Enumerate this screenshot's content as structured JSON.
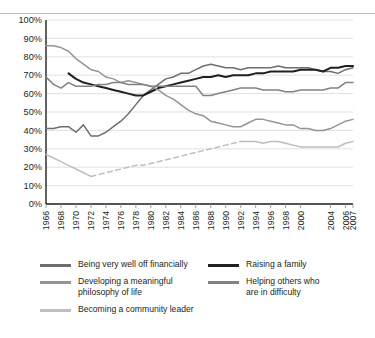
{
  "chart_data": {
    "type": "line",
    "title": "",
    "subtitle": "",
    "xlabel": "",
    "ylabel": "",
    "ylim": [
      0,
      100
    ],
    "y_unit": "%",
    "grid": true,
    "legend_position": "bottom",
    "y_ticks": [
      "0%",
      "10%",
      "20%",
      "30%",
      "40%",
      "50%",
      "60%",
      "70%",
      "80%",
      "90%",
      "100%"
    ],
    "y_tick_values": [
      0,
      10,
      20,
      30,
      40,
      50,
      60,
      70,
      80,
      90,
      100
    ],
    "x_tick_labels": [
      "1966",
      "1968",
      "1970",
      "1972",
      "1974",
      "1976",
      "1978",
      "1980",
      "1982",
      "1984",
      "1986",
      "1988",
      "1990",
      "1992",
      "1994",
      "1996",
      "1998",
      "2000",
      "2004",
      "2006",
      "2007"
    ],
    "x": [
      1966,
      1967,
      1968,
      1969,
      1970,
      1971,
      1972,
      1973,
      1974,
      1975,
      1976,
      1977,
      1978,
      1979,
      1980,
      1981,
      1982,
      1983,
      1984,
      1985,
      1986,
      1987,
      1988,
      1989,
      1990,
      1991,
      1992,
      1993,
      1994,
      1995,
      1996,
      1997,
      1998,
      1999,
      2000,
      2001,
      2002,
      2003,
      2004,
      2005,
      2006,
      2007
    ],
    "series": [
      {
        "name": "Being very well off financially",
        "color": "#6d6e71",
        "style": "solid",
        "values": [
          41,
          41,
          42,
          42,
          39,
          43,
          37,
          37,
          39,
          42,
          45,
          49,
          54,
          59,
          62,
          65,
          68,
          69,
          71,
          71,
          73,
          75,
          76,
          75,
          74,
          74,
          73,
          74,
          74,
          74,
          74,
          75,
          74,
          74,
          74,
          74,
          73,
          72,
          72,
          71,
          73,
          74
        ]
      },
      {
        "name": "Raising a family",
        "color": "#231f20",
        "style": "solid",
        "values": [
          null,
          null,
          null,
          71,
          68,
          66,
          65,
          64,
          63,
          62,
          61,
          60,
          59,
          59,
          61,
          63,
          64,
          65,
          66,
          67,
          68,
          69,
          69,
          70,
          69,
          70,
          70,
          70,
          71,
          71,
          72,
          72,
          72,
          72,
          73,
          73,
          73,
          72,
          74,
          74,
          75,
          75
        ]
      },
      {
        "name": "Developing a meaningful philosophy of life",
        "color": "#939598",
        "style": "solid",
        "values": [
          86,
          86,
          85,
          83,
          79,
          76,
          73,
          72,
          69,
          68,
          66,
          67,
          66,
          65,
          64,
          62,
          59,
          57,
          54,
          51,
          49,
          48,
          45,
          44,
          43,
          42,
          42,
          44,
          46,
          46,
          45,
          44,
          43,
          43,
          41,
          41,
          40,
          40,
          41,
          43,
          45,
          46
        ]
      },
      {
        "name": "Helping others who are in difficulty",
        "color": "#808285",
        "style": "solid",
        "values": [
          69,
          65,
          63,
          66,
          64,
          64,
          64,
          65,
          65,
          66,
          66,
          65,
          65,
          65,
          64,
          64,
          64,
          64,
          64,
          64,
          64,
          59,
          59,
          60,
          61,
          62,
          63,
          63,
          63,
          62,
          62,
          62,
          61,
          61,
          62,
          62,
          62,
          62,
          63,
          63,
          66,
          66
        ]
      },
      {
        "name": "Becoming a community leader",
        "color": "#bcbec0",
        "style": "solid-then-dashed",
        "dash_start": 1972,
        "dash_end": 1992,
        "values": [
          27,
          25,
          23,
          21,
          19,
          17,
          15,
          16,
          17,
          18,
          19,
          20,
          21,
          21,
          22,
          23,
          24,
          25,
          26,
          27,
          28,
          29,
          30,
          31,
          32,
          33,
          34,
          34,
          34,
          33,
          34,
          34,
          33,
          32,
          31,
          31,
          31,
          31,
          31,
          31,
          33,
          34
        ]
      }
    ]
  },
  "legend": {
    "left_column": [
      {
        "label": "Being very well off financially",
        "color": "#6d6e71",
        "swatch": "line-swatch"
      },
      {
        "label": "Developing a meaningful\nphilosophy of life",
        "color": "#939598",
        "swatch": "line-swatch"
      },
      {
        "label": "Becoming a community leader",
        "color": "#bcbec0",
        "swatch": "line-swatch"
      }
    ],
    "right_column": [
      {
        "label": "Raising a family",
        "color": "#231f20",
        "swatch": "line-swatch"
      },
      {
        "label": "Helping others who\nare in difficulty",
        "color": "#808285",
        "swatch": "line-swatch"
      }
    ]
  }
}
